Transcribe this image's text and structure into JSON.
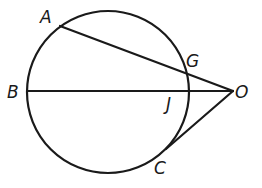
{
  "diagram": {
    "labels": {
      "A": "A",
      "B": "B",
      "G": "G",
      "J": "J",
      "O": "O",
      "C": "C"
    },
    "segments": [
      {
        "from": "A",
        "to": "O",
        "through": "G",
        "type": "secant"
      },
      {
        "from": "B",
        "to": "O",
        "through": "J",
        "type": "secant"
      },
      {
        "from": "C",
        "to": "O",
        "type": "tangent"
      }
    ],
    "colors": {
      "stroke": "#1a1a1a",
      "background": "#ffffff"
    }
  }
}
